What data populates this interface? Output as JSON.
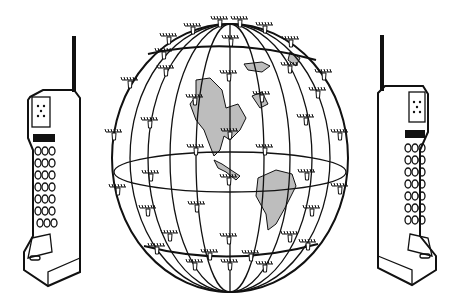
{
  "illustration": {
    "subject": "satellite constellation around globe linking two handheld phones",
    "colors": {
      "line": "#111111",
      "background": "#ffffff",
      "land_fill": "#bdbdbd"
    },
    "elements": {
      "left_phone": {
        "keypad_rows": 7,
        "keypad_cols": 3
      },
      "right_phone": {
        "keypad_rows": 7,
        "keypad_cols": 3
      },
      "globe": {
        "meridian_rings": 7,
        "equator": true
      },
      "satellites_count": 40
    }
  }
}
